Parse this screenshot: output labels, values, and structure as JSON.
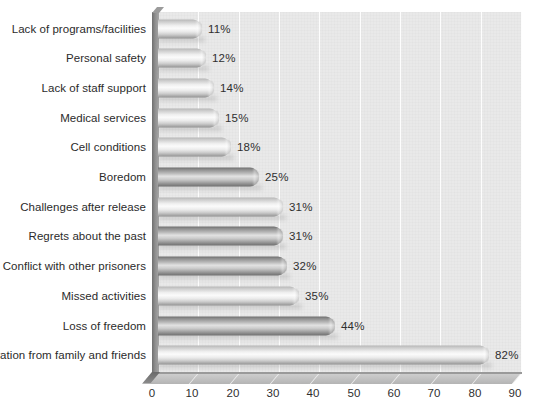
{
  "margin_notes": {
    "title_fragment": "s",
    "line1_fragment": "ank",
    "line2_fragment": "d",
    "line3_fragment": "lew"
  },
  "chart_data": {
    "type": "bar",
    "orientation": "horizontal",
    "title": "",
    "xlabel": "",
    "ylabel": "",
    "xlim": [
      0,
      90
    ],
    "xticks": [
      0,
      10,
      20,
      30,
      40,
      50,
      60,
      70,
      80,
      90
    ],
    "tick_labels": [
      "0",
      "10",
      "20",
      "30",
      "40",
      "50",
      "60",
      "70",
      "80",
      "90"
    ],
    "grid": true,
    "grid_axis": "x",
    "legend": false,
    "value_suffix": "%",
    "style": "3d-cylinder",
    "categories": [
      "Lack of programs/facilities",
      "Personal safety",
      "Lack of staff support",
      "Medical services",
      "Cell conditions",
      "Boredom",
      "Challenges after release",
      "Regrets about the past",
      "Conflict with other prisoners",
      "Missed activities",
      "Loss of freedom",
      "Separation from family and friends"
    ],
    "values": [
      11,
      12,
      14,
      15,
      18,
      25,
      31,
      31,
      32,
      35,
      44,
      82
    ],
    "data_labels": [
      "11%",
      "12%",
      "14%",
      "15%",
      "18%",
      "25%",
      "31%",
      "31%",
      "32%",
      "35%",
      "44%",
      "82%"
    ],
    "bar_shades": [
      "light",
      "light",
      "light",
      "light",
      "light",
      "dark",
      "light",
      "dark",
      "dark",
      "light",
      "dark",
      "light"
    ],
    "colors": {
      "plot_background": "#e9e9e9",
      "gridline": "#fdfdfd",
      "bar_light_peak": "#fbfbfb",
      "bar_light_edge": "#949494",
      "bar_dark_peak": "#e2e2e2",
      "bar_dark_edge": "#6a6a6a",
      "axis_text": "#2f2f2f",
      "category_text": "#2b2b2b",
      "wall": "#8f8f8f",
      "floor": "#c2c2c2"
    }
  }
}
